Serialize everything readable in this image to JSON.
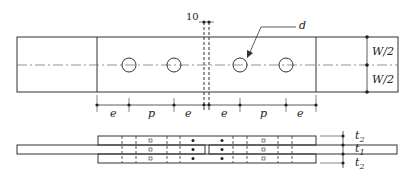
{
  "diagram": {
    "top_view": {
      "gap_label": "10",
      "hole_label": "d",
      "width_labels": [
        "W/2",
        "W/2"
      ],
      "spacing_labels": [
        "e",
        "p",
        "e",
        "e",
        "p",
        "e"
      ]
    },
    "side_view": {
      "thickness_labels": {
        "top": "t",
        "top_sub": "2",
        "middle": "t",
        "middle_sub": "1",
        "bottom": "t",
        "bottom_sub": "2"
      }
    },
    "colors": {
      "line": "#333333",
      "centerline": "#666666",
      "background": "#ffffff"
    }
  }
}
